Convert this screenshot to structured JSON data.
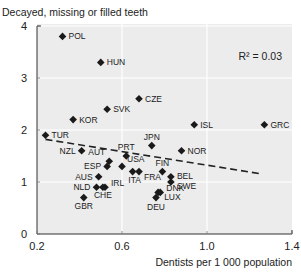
{
  "chart_data": {
    "type": "scatter",
    "title": "",
    "ylabel": "Decayed, missing or filled teeth",
    "xlabel": "Dentists per 1 000 population",
    "xlim": [
      0.2,
      1.4
    ],
    "ylim": [
      0,
      4
    ],
    "xticks": [
      "0.2",
      "0.6",
      "1.0",
      "1.4"
    ],
    "yticks": [
      "0",
      "1",
      "2",
      "3",
      "4"
    ],
    "grid": true,
    "annotation": "R² = 0.03",
    "trendline": {
      "style": "dashed",
      "from": [
        0.24,
        1.82
      ],
      "to": [
        1.25,
        1.16
      ]
    },
    "points": [
      {
        "label": "POL",
        "x": 0.32,
        "y": 3.8
      },
      {
        "label": "HUN",
        "x": 0.5,
        "y": 3.3
      },
      {
        "label": "CZE",
        "x": 0.68,
        "y": 2.6
      },
      {
        "label": "SVK",
        "x": 0.53,
        "y": 2.4
      },
      {
        "label": "KOR",
        "x": 0.37,
        "y": 2.2
      },
      {
        "label": "ISL",
        "x": 0.94,
        "y": 2.1
      },
      {
        "label": "GRC",
        "x": 1.27,
        "y": 2.1
      },
      {
        "label": "TUR",
        "x": 0.24,
        "y": 1.9
      },
      {
        "label": "JPN",
        "x": 0.74,
        "y": 1.7
      },
      {
        "label": "NZL",
        "x": 0.41,
        "y": 1.6
      },
      {
        "label": "NOR",
        "x": 0.88,
        "y": 1.6
      },
      {
        "label": "PRT",
        "x": 0.62,
        "y": 1.5
      },
      {
        "label": "AUT",
        "x": 0.54,
        "y": 1.4
      },
      {
        "label": "ESP",
        "x": 0.53,
        "y": 1.3
      },
      {
        "label": "USA",
        "x": 0.6,
        "y": 1.3
      },
      {
        "label": "FRA",
        "x": 0.68,
        "y": 1.2
      },
      {
        "label": "FIN",
        "x": 0.79,
        "y": 1.2
      },
      {
        "label": "ITA",
        "x": 0.65,
        "y": 1.2
      },
      {
        "label": "AUS",
        "x": 0.49,
        "y": 1.1
      },
      {
        "label": "BEL",
        "x": 0.83,
        "y": 1.1
      },
      {
        "label": "SWE",
        "x": 0.83,
        "y": 1.0
      },
      {
        "label": "NLD",
        "x": 0.48,
        "y": 0.9
      },
      {
        "label": "IRL",
        "x": 0.52,
        "y": 0.9
      },
      {
        "label": "CHE",
        "x": 0.51,
        "y": 0.9
      },
      {
        "label": "DNK",
        "x": 0.78,
        "y": 0.8
      },
      {
        "label": "LUX",
        "x": 0.77,
        "y": 0.8
      },
      {
        "label": "GBR",
        "x": 0.42,
        "y": 0.7
      },
      {
        "label": "DEU",
        "x": 0.76,
        "y": 0.7
      }
    ]
  },
  "colors": {
    "plot_bg": "#ececec",
    "grid": "#ffffff",
    "marker": "#1a1a1a",
    "text": "#222222"
  }
}
